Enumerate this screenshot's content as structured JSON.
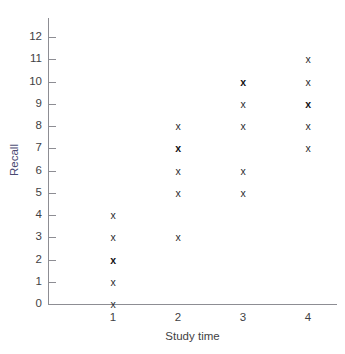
{
  "chart_data": {
    "type": "scatter",
    "title": "",
    "xlabel": "Study time",
    "ylabel": "Recall",
    "xlim": [
      0.5,
      4.6
    ],
    "ylim": [
      0,
      12.8
    ],
    "grid": false,
    "legend": "none",
    "marker": "x",
    "x_ticks": [
      "1",
      "2",
      "3",
      "4"
    ],
    "y_ticks": [
      "0",
      "1",
      "2",
      "3",
      "4",
      "5",
      "6",
      "7",
      "8",
      "9",
      "10",
      "11",
      "12"
    ],
    "points": [
      {
        "x": 1,
        "y": 0,
        "overlap": 1
      },
      {
        "x": 1,
        "y": 1,
        "overlap": 1
      },
      {
        "x": 1,
        "y": 2,
        "overlap": 2
      },
      {
        "x": 1,
        "y": 3,
        "overlap": 1
      },
      {
        "x": 1,
        "y": 4,
        "overlap": 1
      },
      {
        "x": 2,
        "y": 3,
        "overlap": 1
      },
      {
        "x": 2,
        "y": 5,
        "overlap": 1
      },
      {
        "x": 2,
        "y": 6,
        "overlap": 1
      },
      {
        "x": 2,
        "y": 7,
        "overlap": 2
      },
      {
        "x": 2,
        "y": 8,
        "overlap": 1
      },
      {
        "x": 3,
        "y": 5,
        "overlap": 1
      },
      {
        "x": 3,
        "y": 6,
        "overlap": 1
      },
      {
        "x": 3,
        "y": 8,
        "overlap": 1
      },
      {
        "x": 3,
        "y": 9,
        "overlap": 1
      },
      {
        "x": 3,
        "y": 10,
        "overlap": 2
      },
      {
        "x": 4,
        "y": 7,
        "overlap": 1
      },
      {
        "x": 4,
        "y": 8,
        "overlap": 1
      },
      {
        "x": 4,
        "y": 9,
        "overlap": 2
      },
      {
        "x": 4,
        "y": 10,
        "overlap": 1
      },
      {
        "x": 4,
        "y": 11,
        "overlap": 1
      }
    ]
  },
  "colors": {
    "background": "#ffffff",
    "axis": "#8d8d93",
    "tick_text": "#3f3f44",
    "marker": "#2b2b2e",
    "ylabel_text": "#4a4a72"
  }
}
